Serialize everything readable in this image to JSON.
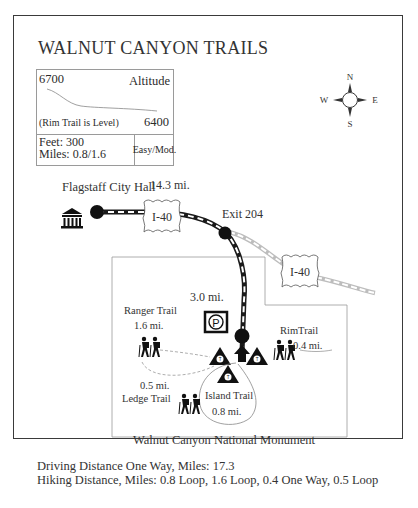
{
  "title": "WALNUT CANYON TRAILS",
  "compass": {
    "n": "N",
    "s": "S",
    "e": "E",
    "w": "W"
  },
  "altitude_box": {
    "high": "6700",
    "label": "Altitude",
    "note": "(Rim Trail is Level)",
    "low": "6400",
    "feet": "Feet: 300",
    "miles": "Miles: 0.8/1.6",
    "difficulty": "Easy/Mod."
  },
  "route": {
    "start": "Flagstaff City Hall",
    "leg1_distance": "14.3 mi.",
    "highway_shield_1": "I-40",
    "exit": "Exit 204",
    "highway_shield_2": "I-40",
    "leg2_distance": "3.0 mi."
  },
  "trails": {
    "ranger": {
      "name": "Ranger Trail",
      "distance": "1.6 mi."
    },
    "rim": {
      "name": "RimTrail",
      "distance": "0.4 mi."
    },
    "ledge": {
      "name": "Ledge Trail",
      "distance": "0.5 mi."
    },
    "island": {
      "name": "Island Trail",
      "distance": "0.8 mi."
    }
  },
  "parking_symbol": "P",
  "area_label": "Walnut Canyon National Monument",
  "footer": {
    "driving": "Driving Distance One Way, Miles: 17.3",
    "hiking": "Hiking Distance, Miles: 0.8 Loop, 1.6 Loop, 0.4 One Way, 0.5 Loop"
  },
  "colors": {
    "road": "#1a1a1a",
    "faded_road": "#cfcfcf",
    "border": "#3a3a3a",
    "boundary": "#9a9a9a"
  }
}
